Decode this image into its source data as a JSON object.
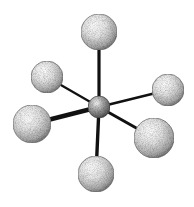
{
  "diagram": {
    "type": "ball-and-stick molecular model",
    "geometry": "octahedral",
    "background": "#ffffff",
    "bond_color": "#111111",
    "center_atom": {
      "cx": 99,
      "cy": 107,
      "r": 11,
      "fill": "#9a9a9a"
    },
    "ligands": [
      {
        "id": "top",
        "cx": 99,
        "cy": 32,
        "r": 18,
        "bond_width": 3.2
      },
      {
        "id": "upper-left",
        "cx": 47,
        "cy": 77,
        "r": 16,
        "bond_width": 2.2
      },
      {
        "id": "upper-right",
        "cx": 168,
        "cy": 90,
        "r": 16,
        "bond_width": 2.4
      },
      {
        "id": "lower-left",
        "cx": 32,
        "cy": 124,
        "r": 19,
        "bond_width": 4.6
      },
      {
        "id": "lower-right",
        "cx": 154,
        "cy": 138,
        "r": 20,
        "bond_width": 3.0
      },
      {
        "id": "bottom",
        "cx": 96,
        "cy": 174,
        "r": 18,
        "bond_width": 3.4
      }
    ]
  }
}
